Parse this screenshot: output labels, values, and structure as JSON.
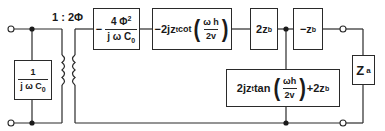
{
  "diagram": {
    "transformer_ratio": "1 : 2Φ",
    "capacitor_box": {
      "num": "1",
      "den_j": "j ω C",
      "den_sub": "0"
    },
    "series_box_1": {
      "minus": "−",
      "num": "4 Φ",
      "num_sup": "2",
      "den": "j ω C",
      "den_sub": "0"
    },
    "series_box_2": {
      "prefix": "−2jz",
      "prefix_sub": "t",
      "func": " cot",
      "arg_num": "ω h",
      "arg_den": "2v"
    },
    "series_box_3": {
      "text": "2z",
      "sub": "b"
    },
    "series_box_4": {
      "text": "−z",
      "sub": "b"
    },
    "shunt_box": {
      "prefix": "2jz",
      "prefix_sub": "t",
      "func": " tan",
      "arg_num": "ωh",
      "arg_den": "2v",
      "suffix": "+2z",
      "suffix_sub": "b"
    },
    "load_box": {
      "text": "Z",
      "sub": "a"
    },
    "colors": {
      "line": "#2a2a2a",
      "background": "#ffffff"
    }
  }
}
